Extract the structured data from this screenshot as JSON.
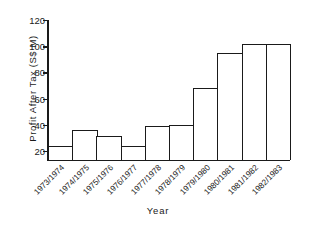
{
  "chart_data": {
    "type": "bar",
    "title": "",
    "xlabel": "Year",
    "ylabel": "Profit After Tax (S$ M)",
    "categories": [
      "1973/1974",
      "1974/1975",
      "1975/1976",
      "1976/1977",
      "1977/1978",
      "1978/1979",
      "1979/1980",
      "1980/1981",
      "1981/1982",
      "1982/1983"
    ],
    "values": [
      24,
      36,
      31,
      24,
      39,
      40,
      68,
      95,
      102,
      102
    ],
    "ylim": [
      13,
      120
    ],
    "yticks": [
      20,
      40,
      60,
      80,
      100,
      120
    ],
    "ytick_labels": [
      "20",
      "40",
      "60",
      "80",
      "100",
      "120"
    ],
    "grid": false,
    "legend": false,
    "bar_fill_color": "#ffffff",
    "bar_edge_color": "#1a1a1a",
    "axis_color": "#1a1a1a",
    "background_color": "#ffffff"
  }
}
